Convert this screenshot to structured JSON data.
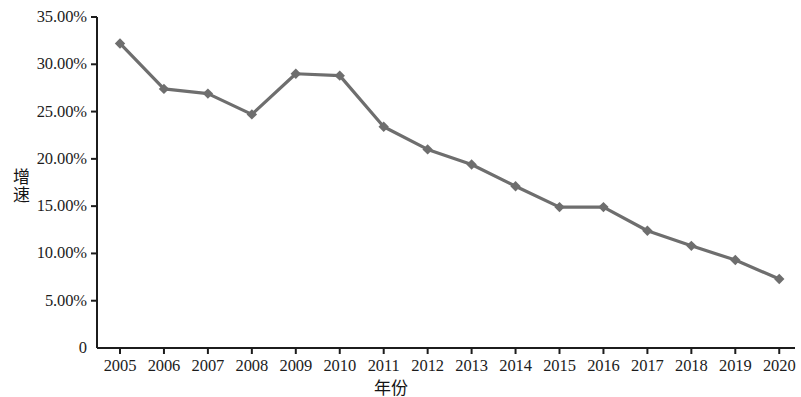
{
  "chart_data": {
    "type": "line",
    "title": "",
    "xlabel": "年份",
    "ylabel": "增速",
    "categories": [
      "2005",
      "2006",
      "2007",
      "2008",
      "2009",
      "2010",
      "2011",
      "2012",
      "2013",
      "2014",
      "2015",
      "2016",
      "2017",
      "2018",
      "2019",
      "2020"
    ],
    "x": [
      2005,
      2006,
      2007,
      2008,
      2009,
      2010,
      2011,
      2012,
      2013,
      2014,
      2015,
      2016,
      2017,
      2018,
      2019,
      2020
    ],
    "values": [
      32.2,
      27.4,
      26.9,
      24.7,
      29.0,
      28.8,
      23.4,
      21.0,
      19.4,
      17.1,
      14.9,
      14.9,
      12.4,
      10.8,
      9.3,
      7.3
    ],
    "value_unit": "%",
    "ylim": [
      0,
      35
    ],
    "ytick_values": [
      0,
      5,
      10,
      15,
      20,
      25,
      30,
      35
    ],
    "ytick_labels": [
      "0",
      "5.00%",
      "10.00%",
      "15.00%",
      "20.00%",
      "25.00%",
      "30.00%",
      "35.00%"
    ],
    "xtick_labels": [
      "2005",
      "2006",
      "2007",
      "2008",
      "2009",
      "2010",
      "2011",
      "2012",
      "2013",
      "2014",
      "2015",
      "2016",
      "2017",
      "2018",
      "2019",
      "2020"
    ],
    "grid": false,
    "legend": null,
    "legend_position": "none",
    "series_color": "#6e6e6e",
    "marker": "diamond",
    "marker_color": "#6e6e6e",
    "axis_color": "#1c1c1c",
    "annotations": []
  },
  "axes": {
    "y_title": "增速",
    "x_title": "年份"
  },
  "colors": {
    "background": "#ffffff",
    "line": "#6e6e6e",
    "marker": "#6e6e6e",
    "axis": "#1c1c1c",
    "text": "#1a1a1a"
  },
  "geometry": {
    "plot_left": 97,
    "plot_right": 795,
    "plot_top": 17,
    "plot_bottom": 348,
    "x_first": 120,
    "x_step": 43.95,
    "y_zero": 348,
    "y_per_unit": 9.457
  }
}
